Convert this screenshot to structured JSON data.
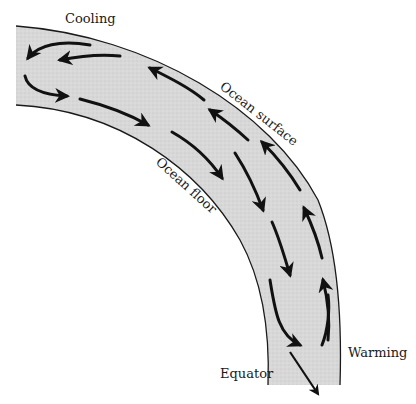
{
  "diagram": {
    "type": "ocean-circulation-cross-section",
    "labels": {
      "cooling": "Cooling",
      "ocean_surface": "Ocean surface",
      "ocean_floor": "Ocean floor",
      "warming": "Warming",
      "equator": "Equator"
    },
    "colors": {
      "water_fill": "#d6d6d6",
      "outline": "#1a1a1a",
      "arrow": "#111111",
      "background": "#ffffff"
    }
  }
}
